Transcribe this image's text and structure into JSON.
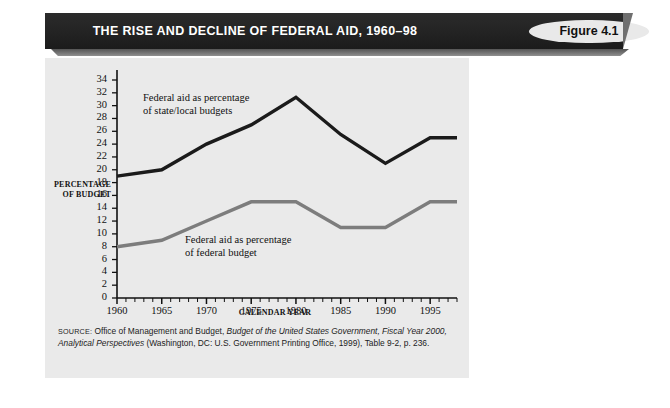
{
  "header": {
    "title": "THE RISE AND DECLINE OF FEDERAL AID, 1960–98",
    "figure_badge": "Figure 4.1",
    "bar_color": "#232323",
    "badge_color": "#e9e9e9"
  },
  "panel": {
    "background_color": "#eaeaea"
  },
  "source": {
    "label": "SOURCE:",
    "line1_a": " Office of Management and Budget, ",
    "line1_italic": "Budget of the United States Government, Fiscal",
    "line2_italic_a": "Year 2000, Analytical Perspectives",
    "line2_b": " (Washington, DC: U.S. Government Printing Office, 1999),",
    "line3": "Table 9-2, p. 236."
  },
  "chart_data": {
    "type": "line",
    "title": "THE RISE AND DECLINE OF FEDERAL AID, 1960–98",
    "xlabel": "CALENDAR YEAR",
    "ylabel": "PERCENTAGE OF BUDGET",
    "ylabel_line1": "PERCENTAGE",
    "ylabel_line2": "OF BUDGET",
    "xlim": [
      1960,
      1998
    ],
    "ylim": [
      0,
      34
    ],
    "ytick_step": 2,
    "yticks": [
      0,
      2,
      4,
      6,
      8,
      10,
      12,
      14,
      16,
      18,
      20,
      22,
      24,
      26,
      28,
      30,
      32,
      34
    ],
    "xticks": [
      1960,
      1965,
      1970,
      1975,
      1980,
      1985,
      1990,
      1995
    ],
    "x_minor_tick_step": 1,
    "grid": false,
    "legend": "inline-annotations",
    "x": [
      1960,
      1965,
      1970,
      1975,
      1980,
      1985,
      1990,
      1995,
      1998
    ],
    "series": [
      {
        "name": "Federal aid as percentage of state/local budgets",
        "label_line1": "Federal aid as percentage",
        "label_line2": "of state/local budgets",
        "color": "#1b1b1b",
        "values": [
          19,
          20,
          24,
          27,
          31.3,
          25.5,
          21,
          25,
          25
        ]
      },
      {
        "name": "Federal aid as percentage of federal budget",
        "label_line1": "Federal aid as percentage",
        "label_line2": "of federal budget",
        "color": "#7d7d7d",
        "values": [
          8,
          9,
          12,
          15,
          15,
          11,
          11,
          15,
          15
        ]
      }
    ]
  }
}
